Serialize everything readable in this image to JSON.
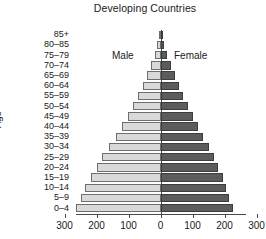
{
  "chart_data": {
    "type": "bar",
    "title": "Developing Countries",
    "xlabel": "",
    "ylabel": "Age",
    "orientation": "population-pyramid",
    "categories": [
      "0–4",
      "5–9",
      "10–14",
      "15–19",
      "20–24",
      "25–29",
      "30–34",
      "35–39",
      "40–44",
      "45–49",
      "50–54",
      "55–59",
      "60–64",
      "65–69",
      "70–74",
      "75–79",
      "80–85",
      "85+"
    ],
    "xlim": [
      -300,
      300
    ],
    "xticks": [
      300,
      200,
      100,
      0,
      100,
      200,
      300
    ],
    "xtick_labels": [
      "300",
      "200",
      "100",
      "0",
      "100",
      "200",
      "300"
    ],
    "grid": false,
    "legend_position": "inside-top",
    "series": [
      {
        "name": "Male",
        "color": "#d9d9d9",
        "side": "left",
        "values": [
          265,
          250,
          235,
          218,
          200,
          182,
          160,
          140,
          120,
          103,
          86,
          70,
          56,
          42,
          30,
          19,
          11,
          5
        ]
      },
      {
        "name": "Female",
        "color": "#5c5c5c",
        "side": "right",
        "values": [
          225,
          215,
          205,
          195,
          180,
          166,
          150,
          133,
          116,
          100,
          85,
          70,
          57,
          44,
          32,
          21,
          12,
          6
        ]
      }
    ]
  },
  "labels": {
    "male": "Male",
    "female": "Female",
    "age_axis": "Age"
  }
}
